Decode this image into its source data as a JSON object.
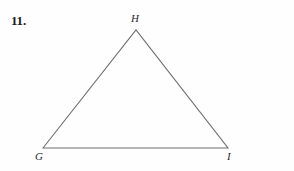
{
  "page": {
    "background_color": "#fefefe",
    "width": 294,
    "height": 171
  },
  "exercise": {
    "number_label": "11."
  },
  "figure": {
    "name": "triangle-GHI",
    "shape": "triangle",
    "stroke_color": "#6e6e6e",
    "stroke_width": 1.1,
    "fill": "none",
    "vertices": [
      {
        "label": "G",
        "x": 43,
        "y": 148,
        "label_x": 35,
        "label_y": 150
      },
      {
        "label": "H",
        "x": 136,
        "y": 30,
        "label_x": 131,
        "label_y": 12
      },
      {
        "label": "I",
        "x": 228,
        "y": 148,
        "label_x": 227,
        "label_y": 150
      }
    ],
    "edges": [
      {
        "name": "GH",
        "from": "G",
        "to": "H"
      },
      {
        "name": "HI",
        "from": "H",
        "to": "I"
      },
      {
        "name": "GI",
        "from": "G",
        "to": "I"
      }
    ],
    "polygon_points": "43,148 136,30 228,148"
  }
}
